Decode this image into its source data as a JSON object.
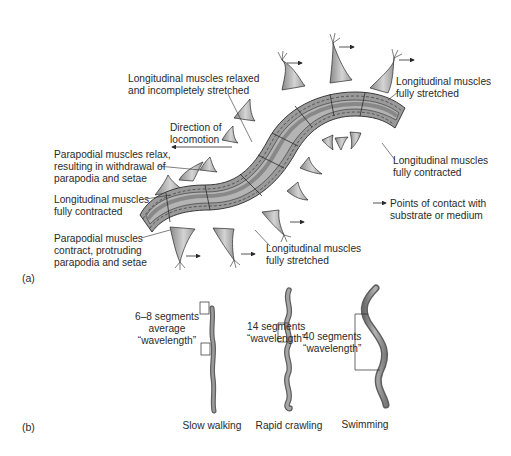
{
  "figure": {
    "panel_a": {
      "label": "(a)",
      "annotations": {
        "relaxed": [
          "Longitudinal muscles relaxed",
          "and incompletely stretched"
        ],
        "direction": [
          "Direction of",
          "locomotion"
        ],
        "parapodial_relax": [
          "Parapodial muscles relax,",
          "resulting in withdrawal of",
          "parapodia and setae"
        ],
        "contracted_left": [
          "Longitudinal muscles",
          "fully contracted"
        ],
        "parapodial_contract": [
          "Parapodial muscles",
          "contract, protruding",
          "parapodia and setae"
        ],
        "stretched_top": [
          "Longitudinal muscles",
          "fully stretched"
        ],
        "contracted_right": [
          "Longitudinal muscles",
          "fully contracted"
        ],
        "stretched_bottom": [
          "Longitudinal muscles",
          "fully stretched"
        ]
      },
      "legend": {
        "symbol": "arrow-right",
        "text": [
          "Points of contact with",
          "substrate or medium"
        ]
      }
    },
    "panel_b": {
      "label": "(b)",
      "worms": [
        {
          "caption": "Slow walking",
          "wavelength_label": [
            "6–8 segments",
            "average",
            "“wavelength”"
          ]
        },
        {
          "caption": "Rapid crawling",
          "wavelength_label": [
            "14 segments",
            "“wavelength”"
          ]
        },
        {
          "caption": "Swimming",
          "wavelength_label": [
            "40 segments",
            "“wavelength”"
          ]
        }
      ]
    },
    "colors": {
      "outline": "#2a2a2a",
      "band_dark": "#7d7d7d",
      "band_mid": "#9a9a9a",
      "band_light": "#b9b9b9",
      "cuticle": "#a8a8a8",
      "parapod": "#b5b5b5",
      "worm_b": "#8e8e8e"
    }
  }
}
